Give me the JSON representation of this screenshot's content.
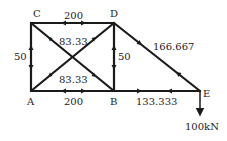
{
  "diagram": {
    "type": "truss",
    "nodes": {
      "A": {
        "label": "A"
      },
      "B": {
        "label": "B"
      },
      "C": {
        "label": "C"
      },
      "D": {
        "label": "D"
      },
      "E": {
        "label": "E"
      }
    },
    "members": [
      {
        "id": "CD",
        "force": "200"
      },
      {
        "id": "AB",
        "force": "200"
      },
      {
        "id": "AC",
        "force": "50"
      },
      {
        "id": "BD",
        "force": "50"
      },
      {
        "id": "CB",
        "force": "83.33"
      },
      {
        "id": "AD",
        "force": "83.33"
      },
      {
        "id": "DE",
        "force": "166.667"
      },
      {
        "id": "BE",
        "force": "133.333"
      }
    ],
    "load": {
      "node": "E",
      "label": "100kN",
      "direction": "down"
    }
  }
}
